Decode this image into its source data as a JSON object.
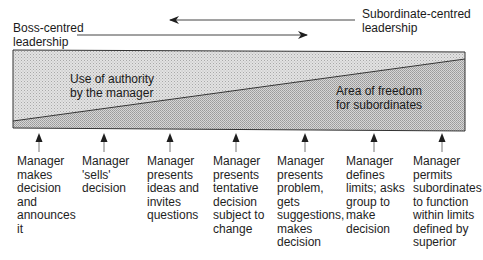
{
  "diagram": {
    "top_labels": {
      "boss_centred": "Boss-centred\nleadership",
      "subordinate_centred": "Subordinate-centred\nleadership"
    },
    "regions": {
      "authority": "Use of authority\nby the manager",
      "freedom": "Area of freedom\nfor subordinates"
    },
    "colors": {
      "authority_fill": "#d8d8d8",
      "freedom_fill": "#c6c6c6",
      "line": "#333333",
      "text": "#1e1e1e"
    },
    "behaviours": [
      {
        "label": "Manager\nmakes\ndecision\nand\nannounces\nit",
        "x": 17,
        "arrow_x": 39
      },
      {
        "label": "Manager\n'sells'\ndecision",
        "x": 82,
        "arrow_x": 104
      },
      {
        "label": "Manager\npresents\nideas and\ninvites\nquestions",
        "x": 147,
        "arrow_x": 170
      },
      {
        "label": "Manager\npresents\ntentative\ndecision\nsubject to\nchange",
        "x": 213,
        "arrow_x": 236
      },
      {
        "label": "Manager\npresents\nproblem,\ngets\nsuggestions,\nmakes\ndecision",
        "x": 277,
        "arrow_x": 305
      },
      {
        "label": "Manager\ndefines\nlimits; asks\ngroup to\nmake\ndecision",
        "x": 346,
        "arrow_x": 374
      },
      {
        "label": "Manager\npermits\nsubordinates\nto function\nwithin limits\ndefined by\nsuperior",
        "x": 413,
        "arrow_x": 442
      }
    ]
  }
}
